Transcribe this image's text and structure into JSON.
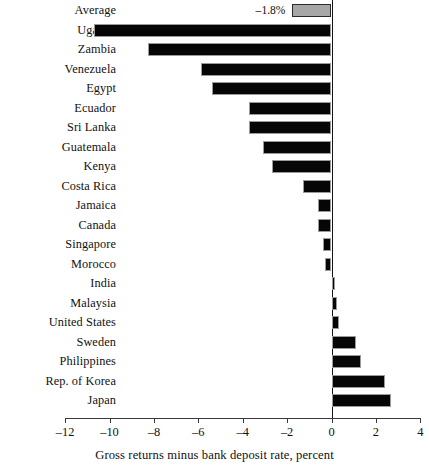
{
  "chart_data": {
    "type": "bar",
    "orientation": "horizontal",
    "title": "",
    "xlabel": "Gross returns minus bank deposit rate, percent",
    "ylabel": "",
    "xlim": [
      -12,
      4
    ],
    "xticks": [
      -12,
      -10,
      -8,
      -6,
      -4,
      -2,
      0,
      2,
      4
    ],
    "xtick_labels": [
      "–12",
      "–10",
      "–8",
      "–6",
      "–4",
      "–2",
      "0",
      "2",
      "4"
    ],
    "grid": false,
    "legend": null,
    "categories": [
      "Average",
      "Uganda",
      "Zambia",
      "Venezuela",
      "Egypt",
      "Ecuador",
      "Sri Lanka",
      "Guatemala",
      "Kenya",
      "Costa Rica",
      "Jamaica",
      "Canada",
      "Singapore",
      "Morocco",
      "India",
      "Malaysia",
      "United States",
      "Sweden",
      "Philippines",
      "Rep. of Korea",
      "Japan"
    ],
    "values": [
      -1.8,
      -10.7,
      -8.25,
      -5.9,
      -5.4,
      -3.7,
      -3.7,
      -3.1,
      -2.7,
      -1.3,
      -0.6,
      -0.6,
      -0.4,
      -0.3,
      0.15,
      0.25,
      0.35,
      1.1,
      1.35,
      2.4,
      2.7
    ],
    "data_labels": {
      "Average": "–1.8%"
    },
    "series_colors": {
      "bar": "#060606",
      "average_bar": "#a7a7a7",
      "axis": "#3a3a3a",
      "text": "#111111"
    },
    "highlight_category": "Average"
  }
}
